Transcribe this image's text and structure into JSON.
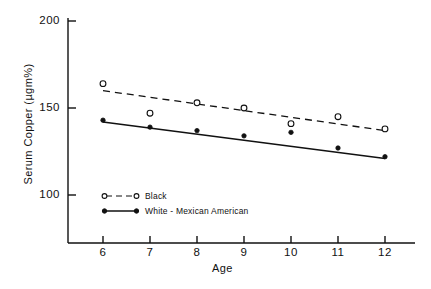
{
  "chart_data": {
    "type": "scatter",
    "title": "",
    "xlabel": "Age",
    "ylabel": "Serum Copper (µgm%)",
    "x": [
      6,
      7,
      8,
      9,
      10,
      11,
      12
    ],
    "xlim": [
      5.3,
      12.6
    ],
    "ylim": [
      88,
      208
    ],
    "xticks": [
      6,
      7,
      8,
      9,
      10,
      11,
      12
    ],
    "xtick_labels": [
      "6",
      "7",
      "8",
      "9",
      "10",
      "11",
      "12"
    ],
    "yticks": [
      100,
      150,
      200
    ],
    "ytick_labels": [
      "100",
      "150",
      "200"
    ],
    "grid": false,
    "legend_position": "lower-left-inside",
    "series": [
      {
        "name": "Black",
        "marker": "open-circle",
        "line_style": "dashed",
        "values": [
          164,
          147,
          153,
          150,
          141,
          145,
          138
        ],
        "fit_start": [
          6,
          160
        ],
        "fit_end": [
          12,
          137
        ]
      },
      {
        "name": "White - Mexican American",
        "marker": "filled-circle",
        "line_style": "solid",
        "values": [
          143,
          139,
          137,
          134,
          136,
          127,
          122
        ],
        "fit_start": [
          6,
          142
        ],
        "fit_end": [
          12,
          121
        ]
      }
    ]
  },
  "axes": {
    "y_tick_200": "200",
    "y_tick_150": "150",
    "y_tick_100": "100",
    "x_tick_6": "6",
    "x_tick_7": "7",
    "x_tick_8": "8",
    "x_tick_9": "9",
    "x_tick_10": "10",
    "x_tick_11": "11",
    "x_tick_12": "12",
    "y_axis_title": "Serum Copper (µgm%)",
    "x_axis_title": "Age"
  },
  "legend": {
    "entry_black": "Black",
    "entry_white_mexican": "White - Mexican American"
  },
  "colors": {
    "ink": "#111111",
    "background": "#ffffff"
  }
}
